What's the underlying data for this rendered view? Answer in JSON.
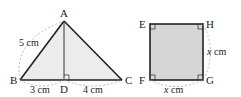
{
  "triangle": {
    "vertices": {
      "A": "A",
      "B": "B",
      "C": "C",
      "D": "D"
    },
    "measurements": {
      "AB": "5 cm",
      "BD": "3 cm",
      "DC": "4 cm"
    },
    "right_angle_at": "D",
    "fill": "#ececec",
    "stroke": "#222222"
  },
  "square": {
    "vertices": {
      "E": "E",
      "F": "F",
      "G": "G",
      "H": "H"
    },
    "side_var": "x",
    "side_unit": " cm",
    "fill": "#d6d6d6",
    "stroke": "#222222"
  },
  "dashed_color": "#999999"
}
